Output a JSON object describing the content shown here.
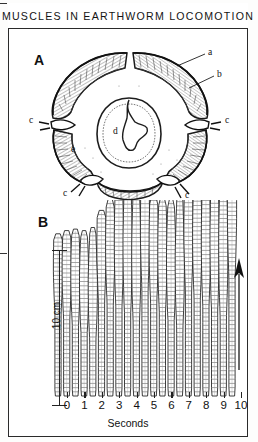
{
  "figure": {
    "title": "MUSCLES IN EARTHWORM LOCOMOTION",
    "background_color": "#ffffff",
    "ink_color": "#111111",
    "frame_color": "#2a2a2a"
  },
  "panel_a": {
    "letter": "A",
    "caption_labels": [
      {
        "key": "a",
        "text": "a",
        "x": 203,
        "y": 48
      },
      {
        "key": "b",
        "text": "b",
        "x": 212,
        "y": 66
      },
      {
        "key": "c_right",
        "text": "c",
        "x": 229,
        "y": 107
      },
      {
        "key": "c_left",
        "text": "c",
        "x": 33,
        "y": 103
      },
      {
        "key": "c_bottom_left",
        "text": "c",
        "x": 48,
        "y": 176
      },
      {
        "key": "c_bottom_right",
        "text": "c",
        "x": 190,
        "y": 196
      },
      {
        "key": "d",
        "text": "d",
        "x": 115,
        "y": 122
      },
      {
        "key": "e",
        "text": "e",
        "x": 68,
        "y": 141
      }
    ]
  },
  "panel_b": {
    "letter": "B",
    "scale_bar": {
      "label": "10 cm",
      "value": 10,
      "unit": "cm"
    },
    "direction_arrow": {
      "name": "direction-of-travel-arrow",
      "points": "up"
    }
  },
  "chart_data": {
    "type": "line",
    "title": "MUSCLES IN EARTHWORM LOCOMOTION",
    "subtitle": "B",
    "xlabel": "Seconds",
    "ylabel": "10 cm",
    "x_tick_labels": [
      "0",
      "1",
      "2",
      "3",
      "4",
      "5",
      "6",
      "7",
      "8",
      "9",
      "10"
    ],
    "x_tick_values": [
      0,
      1,
      2,
      3,
      4,
      5,
      6,
      7,
      8,
      9,
      10
    ],
    "xlim": [
      0,
      10
    ],
    "ylim": [
      0,
      10
    ],
    "y_scale_bar_cm": 10,
    "grid": false,
    "legend": false,
    "series_note": "Successive tracings of a crawling earthworm; each vertical profile is one worm outline recorded at 0.5 s intervals. Value = body length of the tracing in cm measured from the baseline.",
    "categories": [
      "0.0",
      "0.5",
      "1.0",
      "1.5",
      "2.0",
      "2.5",
      "3.0",
      "3.5",
      "4.0",
      "4.5",
      "5.0",
      "5.5",
      "6.0",
      "6.5",
      "7.0",
      "7.5",
      "8.0",
      "8.5",
      "9.0",
      "9.5",
      "10.0"
    ],
    "x": [
      0.0,
      0.5,
      1.0,
      1.5,
      2.0,
      2.5,
      3.0,
      3.5,
      4.0,
      4.5,
      5.0,
      5.5,
      6.0,
      6.5,
      7.0,
      7.5,
      8.0,
      8.5,
      9.0,
      9.5,
      10.0
    ],
    "values": [
      10.4,
      10.6,
      10.7,
      10.6,
      10.8,
      11.9,
      12.6,
      13.6,
      13.9,
      13.9,
      13.4,
      12.8,
      12.7,
      12.6,
      13.0,
      13.2,
      13.3,
      13.6,
      14.5,
      14.9,
      14.8
    ]
  },
  "axis": {
    "tick_labels": [
      "0",
      "1",
      "2",
      "3",
      "4",
      "5",
      "6",
      "7",
      "8",
      "9",
      "10"
    ],
    "title": "Seconds"
  }
}
